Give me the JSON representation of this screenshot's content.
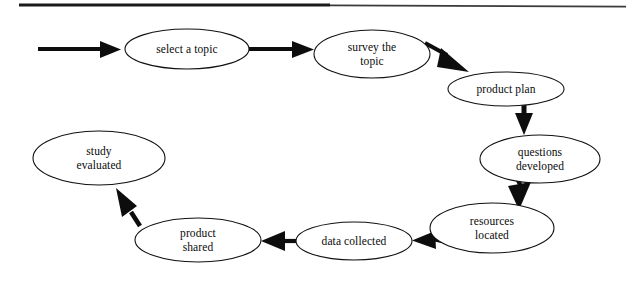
{
  "diagram": {
    "type": "flowchart-cycle",
    "background_color": "#ffffff",
    "stroke_color": "#0d0d0d",
    "node_fill": "#ffffff",
    "top_rule": {
      "name": "top-horizontal-rule",
      "visible": true
    },
    "nodes": [
      {
        "id": "select-a-topic",
        "label": "select a topic",
        "cx": 187,
        "cy": 49,
        "rx": 62,
        "ry": 20
      },
      {
        "id": "survey-the-topic",
        "label": "survey the\ntopic",
        "cx": 372,
        "cy": 54,
        "rx": 58,
        "ry": 24
      },
      {
        "id": "product-plan",
        "label": "product plan",
        "cx": 506,
        "cy": 89,
        "rx": 58,
        "ry": 17
      },
      {
        "id": "questions-developed",
        "label": "questions\ndeveloped",
        "cx": 540,
        "cy": 159,
        "rx": 60,
        "ry": 24
      },
      {
        "id": "resources-located",
        "label": "resources\nlocated",
        "cx": 492,
        "cy": 228,
        "rx": 62,
        "ry": 25
      },
      {
        "id": "data-collected",
        "label": "data collected",
        "cx": 354,
        "cy": 241,
        "rx": 58,
        "ry": 19
      },
      {
        "id": "product-shared",
        "label": "product\nshared",
        "cx": 198,
        "cy": 240,
        "rx": 63,
        "ry": 22
      },
      {
        "id": "study-evaluated",
        "label": "study\nevaluated",
        "cx": 99,
        "cy": 158,
        "rx": 66,
        "ry": 27
      }
    ],
    "edges": [
      {
        "id": "entry-arrow",
        "from": "start",
        "to": "select-a-topic"
      },
      {
        "id": "select-to-survey",
        "from": "select-a-topic",
        "to": "survey-the-topic"
      },
      {
        "id": "survey-to-product-plan",
        "from": "survey-the-topic",
        "to": "product-plan"
      },
      {
        "id": "product-plan-to-questions",
        "from": "product-plan",
        "to": "questions-developed"
      },
      {
        "id": "questions-to-resources",
        "from": "questions-developed",
        "to": "resources-located"
      },
      {
        "id": "resources-to-data",
        "from": "resources-located",
        "to": "data-collected"
      },
      {
        "id": "data-to-product-shared",
        "from": "data-collected",
        "to": "product-shared"
      },
      {
        "id": "product-shared-to-study",
        "from": "product-shared",
        "to": "study-evaluated"
      }
    ]
  }
}
